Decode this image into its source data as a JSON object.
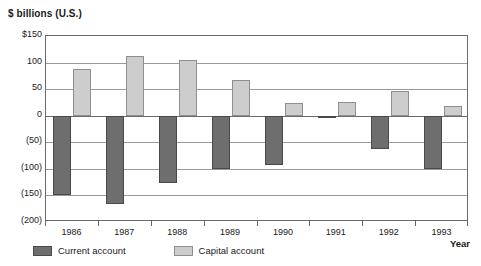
{
  "chart_data": {
    "type": "bar",
    "title": "$ billions (U.S.)",
    "ylabel": "$ billions (U.S.)",
    "xlabel": "Year",
    "categories": [
      "1986",
      "1987",
      "1988",
      "1989",
      "1990",
      "1991",
      "1992",
      "1993"
    ],
    "series": [
      {
        "name": "Current account",
        "color": "#6e6e6e",
        "values": [
          -150,
          -167,
          -127,
          -100,
          -92,
          -5,
          -62,
          -100
        ]
      },
      {
        "name": "Capital account",
        "color": "#cdcdcd",
        "values": [
          88,
          113,
          104,
          68,
          23,
          26,
          46,
          19
        ]
      }
    ],
    "ylim": [
      -200,
      150
    ],
    "yticks": [
      150,
      100,
      50,
      0,
      -50,
      -100,
      -150,
      -200
    ],
    "ytick_labels": [
      "$150",
      "100",
      "50",
      "0",
      "(50)",
      "(100)",
      "(150)",
      "(200)"
    ],
    "grid": true,
    "legend_position": "bottom-left"
  },
  "legend": {
    "items": [
      {
        "label": "Current account",
        "style": "current"
      },
      {
        "label": "Capital account",
        "style": "capital"
      }
    ]
  }
}
